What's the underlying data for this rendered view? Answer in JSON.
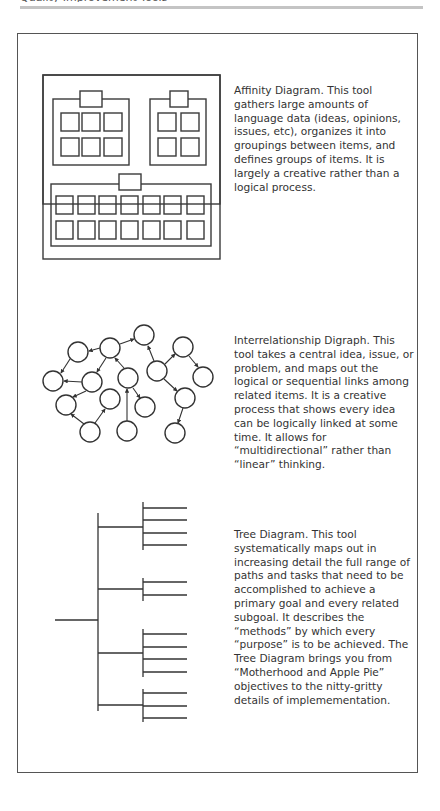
{
  "header": {
    "clipped_text": "Quality Improvement Tools"
  },
  "sections": [
    {
      "id": "affinity",
      "title": "Affinity Diagram",
      "description": "Affinity Diagram. This tool gathers large amounts of language data (ideas, opinions, issues, etc), organizes it into groupings between items, and defines groups of items. It is largely a creative rather than a logical process.",
      "figure": {
        "type": "affinity-diagram",
        "groups": [
          {
            "name": "group-1",
            "rows": 2,
            "cols": 3
          },
          {
            "name": "group-2",
            "rows": 2,
            "cols": 2
          },
          {
            "name": "group-3",
            "rows": 2,
            "cols": 7
          }
        ]
      }
    },
    {
      "id": "digraph",
      "title": "Interrelationship Digraph",
      "description": "Interrelationship Digraph. This tool takes a central idea, issue, or problem, and maps out the logical or sequential links among related items. It is a creative process that shows every idea can be logically linked at some time. It allows for “multidirectional” rather than “linear” thinking.",
      "figure": {
        "type": "interrelationship-digraph",
        "node_count": 16
      }
    },
    {
      "id": "tree",
      "title": "Tree Diagram",
      "description": "Tree Diagram. This tool systematically maps out in increasing detail the full range of paths and tasks that need to be accomplished to achieve a primary goal and every related subgoal. It describes the “methods” by which every “purpose” is to be achieved. The Tree Diagram brings you from “Motherhood and Apple Pie” objectives to the nitty-gritty details of implemementation.",
      "figure": {
        "type": "tree-diagram",
        "branches": [
          4,
          2,
          4,
          3
        ]
      }
    }
  ]
}
